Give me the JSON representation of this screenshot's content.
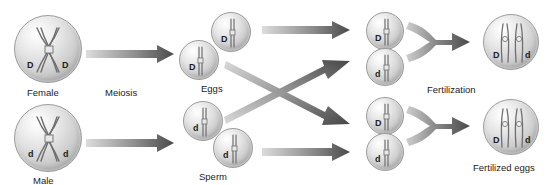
{
  "diagram": {
    "colors": {
      "arrow_light": "#d7d7d7",
      "arrow_dark": "#4d4d4d",
      "cell_edge": "#9a9a9a",
      "text": "#1c1c1c"
    },
    "labels": {
      "female": "Female",
      "male": "Male",
      "meiosis": "Meiosis",
      "eggs": "Eggs",
      "sperm": "Sperm",
      "fertilization": "Fertilization",
      "fertilized_eggs": "Fertilized eggs"
    },
    "parents": [
      {
        "name": "female-cell",
        "allele_left": "D",
        "allele_right": "D",
        "caption": "Female"
      },
      {
        "name": "male-cell",
        "allele_left": "d",
        "allele_right": "d",
        "caption": "Male"
      }
    ],
    "gametes": {
      "eggs": [
        {
          "name": "egg-cell-upper",
          "allele": "D"
        },
        {
          "name": "egg-cell-lower",
          "allele": "D"
        }
      ],
      "sperm": [
        {
          "name": "sperm-cell-upper",
          "allele": "d"
        },
        {
          "name": "sperm-cell-lower",
          "allele": "d"
        }
      ]
    },
    "zygote_gametes": [
      {
        "name": "zygote-gamete-1-egg",
        "allele": "D"
      },
      {
        "name": "zygote-gamete-1-sperm",
        "allele": "d"
      },
      {
        "name": "zygote-gamete-2-egg",
        "allele": "D"
      },
      {
        "name": "zygote-gamete-2-sperm",
        "allele": "d"
      }
    ],
    "fertilized_eggs": [
      {
        "name": "fertilized-egg-upper",
        "allele_left": "D",
        "allele_right": "d"
      },
      {
        "name": "fertilized-egg-lower",
        "allele_left": "D",
        "allele_right": "d"
      }
    ]
  }
}
